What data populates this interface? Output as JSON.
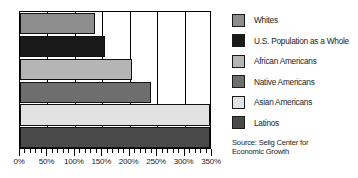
{
  "chart_data": {
    "type": "bar",
    "orientation": "horizontal",
    "title": "",
    "xlabel": "",
    "ylabel": "",
    "xlim": [
      0,
      350
    ],
    "xticks": [
      0,
      50,
      100,
      150,
      200,
      250,
      300,
      350
    ],
    "xtick_labels": [
      "0%",
      "50%",
      "100%",
      "150%",
      "200%",
      "250%",
      "300%",
      "350%"
    ],
    "minor_tick_step": 10,
    "grid": true,
    "grid_axis": "x",
    "legend_position": "right",
    "categories": [
      "Whites",
      "U.S. Population as a Whole",
      "African Americans",
      "Native Americans",
      "Asian Americans",
      "Latinos"
    ],
    "values": [
      137,
      155,
      204,
      239,
      346,
      346
    ],
    "colors": [
      "#8d8d8d",
      "#1a1a1a",
      "#b5b5b5",
      "#6e6e6e",
      "#e2e2e2",
      "#4a4a4a"
    ],
    "source": "Source: Selig Center for Economic Growth"
  },
  "legend": {
    "items": [
      {
        "label": "Whites",
        "color": "#8d8d8d"
      },
      {
        "label": "U.S. Population as a Whole",
        "color": "#1a1a1a"
      },
      {
        "label": "African Americans",
        "color": "#b5b5b5"
      },
      {
        "label": "Native Americans",
        "color": "#6e6e6e"
      },
      {
        "label": "Asian Americans",
        "color": "#e2e2e2"
      },
      {
        "label": "Latinos",
        "color": "#4a4a4a"
      }
    ]
  },
  "source_note": {
    "line1": "Source: Selig Center for",
    "line2": "Economic Growth"
  }
}
